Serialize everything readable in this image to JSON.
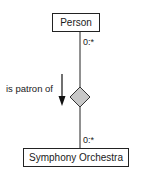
{
  "diagram": {
    "type": "UML association (ER-style relationship)",
    "entities": [
      {
        "id": "person",
        "label": "Person"
      },
      {
        "id": "orchestra",
        "label": "Symphony Orchestra"
      }
    ],
    "relationship": {
      "label": "is patron of",
      "direction": "down",
      "symbol": "diamond",
      "diamond_fill": "#c8c8c8",
      "multiplicity_top": "0:*",
      "multiplicity_bottom": "0:*"
    },
    "colors": {
      "line": "#222222",
      "box_border": "#222222",
      "background": "#ffffff"
    }
  }
}
